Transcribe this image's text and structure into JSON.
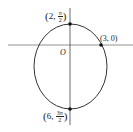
{
  "diagram": {
    "type": "polar-conic-ellipse",
    "origin_label": "O",
    "points": [
      {
        "label_r": "2",
        "label_theta_num": "π",
        "label_theta_den": "2",
        "description": "top vertex"
      },
      {
        "label": "(3, 0)",
        "description": "right intercept"
      },
      {
        "label_r": "6",
        "label_theta_num": "3π",
        "label_theta_den": "2",
        "description": "bottom vertex"
      }
    ]
  }
}
